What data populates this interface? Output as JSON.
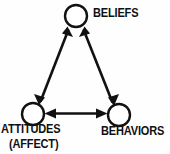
{
  "diagram": {
    "background_color": "#fefefe",
    "stroke_color": "#111111",
    "node_fill_color": "#ffffff",
    "nodes": [
      {
        "id": "beliefs",
        "label": "BELIEFS",
        "shape": "circle",
        "cx": 76,
        "cy": 16,
        "r": 11,
        "label_position": "right"
      },
      {
        "id": "attitudes",
        "label": "ATTITUDES",
        "sublabel": "(AFFECT)",
        "shape": "circle",
        "cx": 33,
        "cy": 114,
        "r": 11,
        "label_position": "below"
      },
      {
        "id": "behaviors",
        "label": "BEHAVIORS",
        "shape": "circle",
        "cx": 119,
        "cy": 115,
        "r": 11,
        "label_position": "below"
      }
    ],
    "edges": [
      {
        "id": "edge-attitudes-beliefs",
        "from": "attitudes",
        "to": "beliefs",
        "arrow": "double",
        "style": "solid"
      },
      {
        "id": "edge-beliefs-behaviors",
        "from": "beliefs",
        "to": "behaviors",
        "arrow": "double",
        "style": "solid"
      },
      {
        "id": "edge-attitudes-behaviors",
        "from": "attitudes",
        "to": "behaviors",
        "arrow": "double",
        "style": "solid"
      }
    ]
  }
}
